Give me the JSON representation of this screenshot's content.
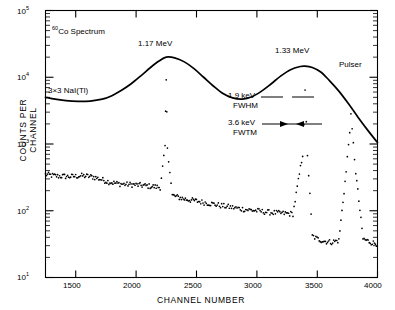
{
  "figure": {
    "title_none": "",
    "curve_label_isotope_sup": "60",
    "curve_label_isotope": "Co Spectrum",
    "detector_label": "3×3 NaI(Tl)",
    "annotations": {
      "peak1": "1.17 MeV",
      "peak2": "1.33 MeV",
      "pulser": "Pulser",
      "fwhm_value": "1.9 keV",
      "fwhm_label": "FWHM",
      "fwtm_value": "3.6 keV",
      "fwtm_label": "FWTM"
    }
  },
  "axes": {
    "x": {
      "title": "CHANNEL NUMBER",
      "ticks": [
        1500,
        2000,
        2500,
        3000,
        3500,
        4000
      ],
      "tick_labels": [
        "1500",
        "2000",
        "2500",
        "3000",
        "3500",
        "4000"
      ],
      "min": 1250,
      "max": 4000
    },
    "y": {
      "title": "COUNTS PER CHANNEL",
      "scale": "log",
      "min": 10,
      "max": 100000,
      "tick_labels": [
        "10",
        "10",
        "10",
        "10",
        "10"
      ],
      "tick_exponents": [
        "5",
        "4",
        "3",
        "2",
        "1"
      ],
      "decades": [
        100000,
        10000,
        1000,
        100,
        10
      ]
    }
  },
  "chart_data": {
    "type": "line",
    "title": "60Co Spectrum",
    "xlabel": "CHANNEL NUMBER",
    "ylabel": "COUNTS PER CHANNEL",
    "yscale": "log",
    "xlim": [
      1250,
      4000
    ],
    "ylim": [
      10,
      100000
    ],
    "grid": false,
    "legend": "none",
    "series": [
      {
        "name": "3×3 NaI(Tl)",
        "type": "line",
        "style": "smooth-solid",
        "color": "#000000",
        "comment": "broad photopeaks at channels 2250 and 3400",
        "x": [
          1250,
          1330,
          1420,
          1520,
          1620,
          1720,
          1800,
          1880,
          1960,
          2040,
          2120,
          2190,
          2250,
          2320,
          2400,
          2480,
          2560,
          2640,
          2720,
          2800,
          2880,
          2960,
          3040,
          3120,
          3200,
          3280,
          3360,
          3400,
          3460,
          3530,
          3600,
          3680,
          3760,
          3840,
          3920,
          4000
        ],
        "y": [
          5000,
          4700,
          4450,
          4350,
          4400,
          4700,
          5300,
          6400,
          8000,
          10500,
          14000,
          17500,
          20000,
          19500,
          17000,
          13500,
          10000,
          7400,
          5700,
          4900,
          4700,
          5100,
          6200,
          8000,
          10500,
          13000,
          14500,
          14700,
          14000,
          12000,
          9000,
          6200,
          4000,
          2500,
          1600,
          1050
        ]
      },
      {
        "name": "Ge(Li) detector spectrum",
        "type": "scatter",
        "style": "dots",
        "color": "#000000",
        "comment": "Compton continuum with sharp 1.17 and 1.33 MeV photopeaks plus pulser peak",
        "x": [
          1250,
          1300,
          1350,
          1400,
          1450,
          1500,
          1550,
          1600,
          1650,
          1700,
          1750,
          1800,
          1850,
          1900,
          1950,
          2000,
          2050,
          2100,
          2150,
          2200,
          2240,
          2250,
          2260,
          2300,
          2350,
          2400,
          2450,
          2500,
          2600,
          2700,
          2800,
          2900,
          3000,
          3100,
          3200,
          3300,
          3380,
          3400,
          3420,
          3460,
          3500,
          3560,
          3620,
          3680,
          3740,
          3780,
          3820,
          3880,
          3940,
          4000
        ],
        "y": [
          350,
          340,
          330,
          330,
          325,
          330,
          335,
          330,
          320,
          300,
          280,
          265,
          255,
          250,
          248,
          245,
          240,
          235,
          230,
          225,
          900,
          9000,
          900,
          170,
          160,
          150,
          145,
          140,
          130,
          120,
          112,
          105,
          100,
          95,
          92,
          90,
          700,
          6000,
          700,
          42,
          38,
          35,
          34,
          36,
          380,
          2600,
          380,
          38,
          34,
          32
        ]
      }
    ],
    "markers": [
      {
        "label": "1.17 MeV",
        "x": 2250,
        "kind": "peak-annotation"
      },
      {
        "label": "1.33 MeV",
        "x": 3400,
        "kind": "peak-annotation"
      },
      {
        "label": "Pulser",
        "x": 3780,
        "kind": "peak-annotation"
      },
      {
        "label": "1.9 keV FWHM",
        "x": 3400,
        "kind": "width-annotation"
      },
      {
        "label": "3.6 keV FWTM",
        "x": 3400,
        "kind": "width-annotation"
      }
    ]
  }
}
